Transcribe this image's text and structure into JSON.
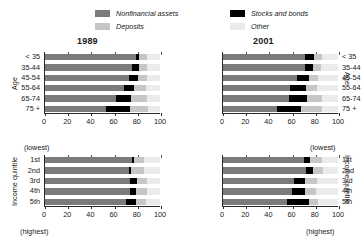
{
  "legend": {
    "items": [
      {
        "label": "Nonfinancial assets",
        "color": "#7b7b7b",
        "key": "nonfinancial"
      },
      {
        "label": "Deposits",
        "color": "#c6c6c6",
        "key": "deposits"
      },
      {
        "label": "Stocks and bonds",
        "color": "#000000",
        "key": "stocks"
      },
      {
        "label": "Other",
        "color": "#ebebeb",
        "key": "other"
      }
    ]
  },
  "colors": {
    "nonfinancial": "#7b7b7b",
    "stocks": "#000000",
    "deposits": "#c6c6c6",
    "other": "#ebebeb",
    "axis": "#2a2a2a"
  },
  "axis": {
    "ticks": [
      "0",
      "20",
      "40",
      "60",
      "80",
      "100"
    ],
    "min": 0,
    "max": 100
  },
  "notes": {
    "lowest": "(lowest)",
    "highest": "(highest)"
  },
  "axis_titles": {
    "age": "Age",
    "quintile": "Income quintile"
  },
  "chart_data": [
    {
      "type": "bar",
      "title": "1989",
      "panel": "top-left",
      "orientation": "horizontal",
      "stacked": true,
      "label_side": "left",
      "xlabel": "",
      "ylabel": "Age",
      "xlim": [
        0,
        100
      ],
      "grid": false,
      "legend_position": "top",
      "categories": [
        "< 35",
        "35-44",
        "45-54",
        "55-64",
        "65-74",
        "75 +"
      ],
      "series": [
        {
          "name": "Nonfinancial assets",
          "values": [
            79,
            76,
            73,
            69,
            62,
            53
          ]
        },
        {
          "name": "Stocks and bonds",
          "values": [
            3,
            6,
            8,
            8,
            13,
            21
          ]
        },
        {
          "name": "Deposits",
          "values": [
            7,
            7,
            8,
            11,
            14,
            16
          ]
        },
        {
          "name": "Other",
          "values": [
            11,
            11,
            11,
            12,
            11,
            10
          ]
        }
      ]
    },
    {
      "type": "bar",
      "title": "2001",
      "panel": "top-right",
      "orientation": "horizontal",
      "stacked": true,
      "label_side": "right",
      "xlabel": "",
      "ylabel": "Age",
      "xlim": [
        0,
        100
      ],
      "grid": false,
      "legend_position": "top",
      "categories": [
        "< 35",
        "35-44",
        "45-54",
        "55-64",
        "65-74",
        "75 +"
      ],
      "series": [
        {
          "name": "Nonfinancial assets",
          "values": [
            71,
            71,
            64,
            58,
            57,
            47
          ]
        },
        {
          "name": "Stocks and bonds",
          "values": [
            8,
            7,
            11,
            14,
            16,
            21
          ]
        },
        {
          "name": "Deposits",
          "values": [
            7,
            7,
            8,
            10,
            13,
            18
          ]
        },
        {
          "name": "Other",
          "values": [
            14,
            15,
            17,
            18,
            14,
            14
          ]
        }
      ]
    },
    {
      "type": "bar",
      "title": "1989",
      "panel": "bottom-left",
      "orientation": "horizontal",
      "stacked": true,
      "label_side": "left",
      "xlabel": "",
      "ylabel": "Income quintile",
      "xlim": [
        0,
        100
      ],
      "grid": false,
      "legend_position": "top",
      "categories": [
        "1st",
        "2nd",
        "3rd",
        "4th",
        "5th"
      ],
      "series": [
        {
          "name": "Nonfinancial assets",
          "values": [
            76,
            73,
            74,
            74,
            70
          ]
        },
        {
          "name": "Stocks and bonds",
          "values": [
            1,
            2,
            6,
            5,
            9
          ]
        },
        {
          "name": "Deposits",
          "values": [
            9,
            11,
            9,
            10,
            9
          ]
        },
        {
          "name": "Other",
          "values": [
            14,
            14,
            11,
            11,
            12
          ]
        }
      ]
    },
    {
      "type": "bar",
      "title": "2001",
      "panel": "bottom-right",
      "orientation": "horizontal",
      "stacked": true,
      "label_side": "right",
      "xlabel": "",
      "ylabel": "Income quintile",
      "xlim": [
        0,
        100
      ],
      "grid": false,
      "legend_position": "top",
      "categories": [
        "1st",
        "2nd",
        "3rd",
        "4th",
        "5th"
      ],
      "series": [
        {
          "name": "Nonfinancial assets",
          "values": [
            70,
            72,
            62,
            60,
            56
          ]
        },
        {
          "name": "Stocks and bonds",
          "values": [
            6,
            6,
            9,
            11,
            19
          ]
        },
        {
          "name": "Deposits",
          "values": [
            10,
            9,
            11,
            10,
            8
          ]
        },
        {
          "name": "Other",
          "values": [
            14,
            13,
            18,
            19,
            17
          ]
        }
      ]
    }
  ]
}
